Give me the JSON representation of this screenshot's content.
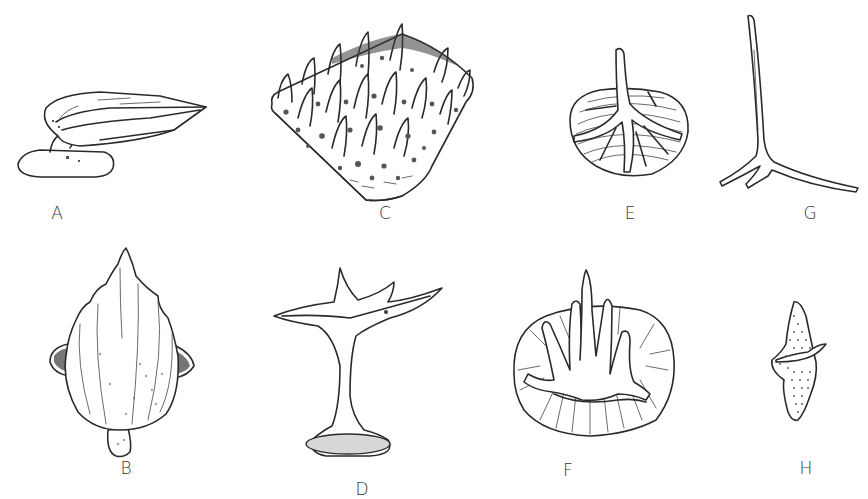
{
  "figure": {
    "type": "scientific-illustration-plate",
    "background": "#ffffff",
    "ink_color": "#2a2a2a",
    "panels": [
      {
        "id": "A",
        "label": "A",
        "description": "elongate scale with pointed crown on flat base, side view"
      },
      {
        "id": "B",
        "label": "B",
        "description": "leaf-shaped ridged scale with lateral lobes and basal knob"
      },
      {
        "id": "C",
        "label": "C",
        "description": "rhomboid plate covered with pointed spines and pits"
      },
      {
        "id": "D",
        "label": "D",
        "description": "mushroom-shaped denticle with spiny crown, slender neck and oval basal plate"
      },
      {
        "id": "E",
        "label": "E",
        "description": "rounded concentrically striated base with single erect spine and radiating ridges"
      },
      {
        "id": "G",
        "label": "G",
        "description": "tri-radiate spicule with long vertical spine"
      },
      {
        "id": "F",
        "label": "F",
        "description": "oval radially striated plate with three spines and curved arms"
      },
      {
        "id": "H",
        "label": "H",
        "description": "small spindle-shaped stippled scale with hooked central cusp"
      }
    ]
  }
}
